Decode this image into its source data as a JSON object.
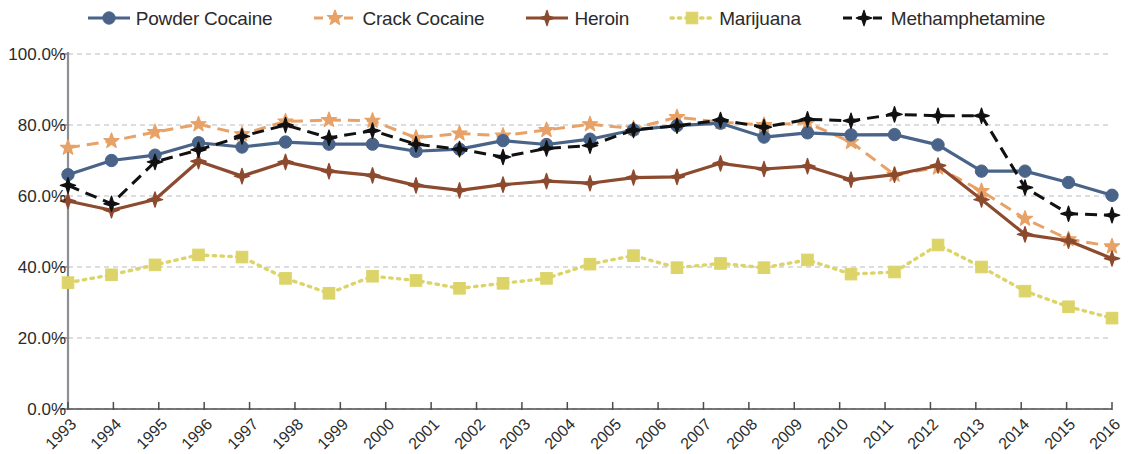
{
  "legend": {
    "position": "top-center",
    "items": [
      {
        "label": "Powder Cocaine",
        "color": "#4a6489",
        "marker": "circle",
        "dash": "solid"
      },
      {
        "label": "Crack Cocaine",
        "color": "#e8a166",
        "marker": "star",
        "dash": "dashed"
      },
      {
        "label": "Heroin",
        "color": "#8c4a2f",
        "marker": "diamond",
        "dash": "solid"
      },
      {
        "label": "Marijuana",
        "color": "#dcd469",
        "marker": "square",
        "dash": "dotted"
      },
      {
        "label": "Methamphetamine",
        "color": "#111111",
        "marker": "diamond",
        "dash": "dashed"
      }
    ]
  },
  "axes": {
    "y_ticks": [
      "0.0%",
      "20.0%",
      "40.0%",
      "60.0%",
      "80.0%",
      "100.0%"
    ],
    "x_ticks": [
      "1993",
      "1994",
      "1995",
      "1996",
      "1997",
      "1998",
      "1999",
      "2000",
      "2001",
      "2002",
      "2003",
      "2004",
      "2005",
      "2006",
      "2007",
      "2008",
      "2009",
      "2010",
      "2011",
      "2012",
      "2013",
      "2014",
      "2015",
      "2016"
    ]
  },
  "chart_data": {
    "type": "line",
    "title": "",
    "xlabel": "",
    "ylabel": "",
    "ylim": [
      0,
      100
    ],
    "ytick_step": 20,
    "grid": "horizontal-dashed",
    "legend_position": "top-center",
    "categories": [
      "1993",
      "1994",
      "1995",
      "1996",
      "1997",
      "1998",
      "1999",
      "2000",
      "2001",
      "2002",
      "2003",
      "2004",
      "2005",
      "2006",
      "2007",
      "2008",
      "2009",
      "2010",
      "2011",
      "2012",
      "2013",
      "2013.5",
      "2014",
      "2015",
      "2016"
    ],
    "series": [
      {
        "name": "Powder Cocaine",
        "color": "#4a6489",
        "marker": "circle",
        "dash": "solid",
        "values": [
          66.0,
          70.0,
          71.5,
          75.0,
          73.8,
          75.2,
          74.6,
          74.6,
          72.6,
          73.2,
          75.6,
          74.5,
          76.0,
          78.6,
          79.8,
          80.5,
          76.6,
          77.8,
          77.2,
          77.3,
          74.4,
          67.0,
          67.0,
          63.8,
          60.2
        ]
      },
      {
        "name": "Crack Cocaine",
        "color": "#e8a166",
        "marker": "star",
        "dash": "dashed",
        "values": [
          73.6,
          75.5,
          78.0,
          80.2,
          77.4,
          81.0,
          81.4,
          81.2,
          76.4,
          77.6,
          77.0,
          78.6,
          80.2,
          79.0,
          82.2,
          80.8,
          80.0,
          80.6,
          75.2,
          66.0,
          68.0,
          61.4,
          53.6,
          47.8,
          45.8
        ]
      },
      {
        "name": "Heroin",
        "color": "#8c4a2f",
        "marker": "diamond",
        "dash": "solid",
        "values": [
          58.6,
          56.0,
          59.0,
          69.8,
          65.6,
          69.6,
          67.0,
          65.8,
          63.0,
          61.6,
          63.2,
          64.2,
          63.6,
          65.2,
          65.4,
          69.2,
          67.6,
          68.4,
          64.6,
          66.0,
          68.6,
          59.0,
          49.2,
          47.4,
          42.4
        ]
      },
      {
        "name": "Marijuana",
        "color": "#dcd469",
        "marker": "square",
        "dash": "dotted",
        "values": [
          35.6,
          37.8,
          40.6,
          43.4,
          42.8,
          36.8,
          32.6,
          37.4,
          36.2,
          34.0,
          35.4,
          36.8,
          40.8,
          43.2,
          39.8,
          41.0,
          39.8,
          42.0,
          38.0,
          38.6,
          46.2,
          40.0,
          33.2,
          28.8,
          25.6
        ]
      },
      {
        "name": "Methamphetamine",
        "color": "#111111",
        "marker": "diamond",
        "dash": "dashed",
        "values": [
          63.0,
          57.8,
          69.6,
          73.0,
          76.8,
          80.0,
          76.4,
          78.4,
          74.6,
          73.2,
          71.0,
          73.4,
          74.2,
          78.6,
          79.8,
          81.4,
          79.4,
          81.6,
          81.2,
          83.0,
          82.6,
          82.6,
          62.4,
          55.0,
          54.6
        ]
      }
    ]
  }
}
